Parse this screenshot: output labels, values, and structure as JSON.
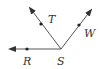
{
  "diagram": {
    "type": "geometry-rays",
    "vertex": {
      "label": "S",
      "x": 61,
      "y": 49
    },
    "rays": [
      {
        "name": "SR",
        "point_label": "R",
        "point": {
          "x": 27,
          "y": 49
        },
        "end": {
          "x": 8,
          "y": 49
        }
      },
      {
        "name": "ST",
        "point_label": "T",
        "point": {
          "x": 41,
          "y": 24
        },
        "end": {
          "x": 29,
          "y": 7
        }
      },
      {
        "name": "SW",
        "point_label": "W",
        "point": {
          "x": 79,
          "y": 25
        },
        "end": {
          "x": 92,
          "y": 9
        }
      }
    ],
    "labels": {
      "S": "S",
      "R": "R",
      "T": "T",
      "W": "W"
    },
    "colors": {
      "line": "#555555",
      "point": "#222222",
      "text": "#333333"
    }
  }
}
